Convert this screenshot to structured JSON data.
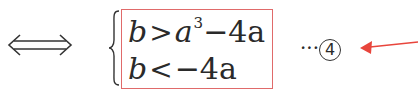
{
  "equation": {
    "equivalence_symbol": "⟺",
    "line1": {
      "lhs": "b",
      "relation": ">",
      "rhs_base": "a",
      "rhs_exp": "3",
      "rhs_rest": "−4a"
    },
    "line2": {
      "lhs": "b",
      "relation": "<",
      "rhs": "−4a"
    }
  },
  "label": {
    "dots": "···",
    "number": "4"
  },
  "colors": {
    "box_border": "#e06a6a",
    "arrow": "#e8453c"
  },
  "partial_text_below": "..."
}
